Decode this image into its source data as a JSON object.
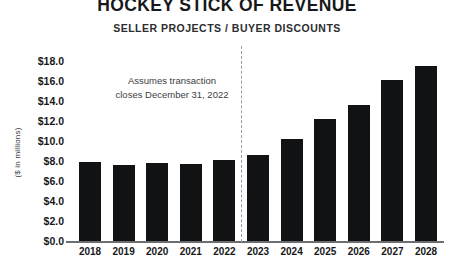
{
  "chart_data": {
    "type": "bar",
    "title": "HOCKEY STICK OF REVENUE",
    "subtitle": "SELLER PROJECTS / BUYER DISCOUNTS",
    "xlabel": "",
    "ylabel": "($ in millions)",
    "categories": [
      "2018",
      "2019",
      "2020",
      "2021",
      "2022",
      "2023",
      "2024",
      "2025",
      "2026",
      "2027",
      "2028"
    ],
    "values": [
      7.9,
      7.6,
      7.8,
      7.7,
      8.1,
      8.6,
      10.2,
      12.2,
      13.6,
      16.1,
      17.5
    ],
    "ylim": [
      0,
      18
    ],
    "ytick_values": [
      18.0,
      16.0,
      14.0,
      12.0,
      10.0,
      8.0,
      6.0,
      4.0,
      2.0,
      0.0
    ],
    "ytick_labels": [
      "$18.0",
      "$16.0",
      "$14.0",
      "$12.0",
      "$10.0",
      "$8.0",
      "$6.0",
      "$4.0",
      "$2.0",
      "$0.0"
    ],
    "grid": false,
    "legend": "none",
    "bar_color": "#111214",
    "annotations": [
      {
        "name": "transaction-close-note",
        "line1": "Assumes transaction",
        "line2": "closes December 31, 2022"
      }
    ],
    "divider": {
      "name": "historical-projection-divider",
      "after_category": "2022",
      "style": "dashed",
      "color": "#9a9ca0"
    }
  }
}
